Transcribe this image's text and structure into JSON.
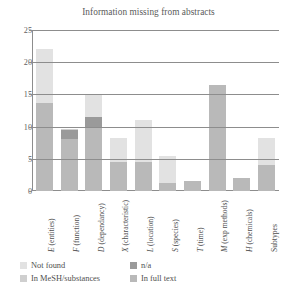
{
  "chart_data": {
    "type": "bar",
    "title": "Information missing from abstracts",
    "xlabel": "",
    "ylabel": "",
    "ylim": [
      0,
      25
    ],
    "yticks": [
      0,
      5,
      10,
      15,
      20,
      25
    ],
    "grid": true,
    "stacked": true,
    "legend_position": "bottom",
    "categories": [
      "E (entities)",
      "F (function)",
      "D (dependancy)",
      "X (characteristic)",
      "L (location)",
      "S (species)",
      "T (time)",
      "M (exp methods)",
      "H (chemicals)",
      "Subtypes"
    ],
    "series": [
      {
        "name": "In full text",
        "color": "#b9b9b9",
        "values": [
          13.7,
          8.0,
          10.0,
          4.5,
          4.5,
          1.2,
          1.5,
          16.5,
          2.0,
          4.0
        ]
      },
      {
        "name": "n/a",
        "color": "#9a9a9a",
        "values": [
          0,
          1.5,
          1.5,
          0,
          0,
          0,
          0,
          0,
          0,
          0
        ]
      },
      {
        "name": "In MeSH/substances",
        "color": "#cfcfcf",
        "values": [
          0,
          0.2,
          0,
          0,
          0,
          0,
          0,
          0,
          0,
          0
        ]
      },
      {
        "name": "Not found",
        "color": "#e2e2e2",
        "values": [
          8.3,
          0,
          3.5,
          3.8,
          6.5,
          4.3,
          0,
          0,
          0,
          4.3
        ]
      }
    ],
    "totals": [
      22.0,
      9.7,
      15.0,
      8.3,
      11.0,
      5.5,
      1.5,
      16.5,
      2.0,
      8.3
    ]
  },
  "legend": {
    "entries": [
      {
        "label": "Not found",
        "color": "#e2e2e2"
      },
      {
        "label": "n/a",
        "color": "#9a9a9a"
      },
      {
        "label": "In MeSH/substances",
        "color": "#cfcfcf"
      },
      {
        "label": "In full text",
        "color": "#b9b9b9"
      }
    ]
  },
  "axis": {
    "frame_color": "#8d8d8d",
    "tick_text_color": "#5f5f5f"
  }
}
